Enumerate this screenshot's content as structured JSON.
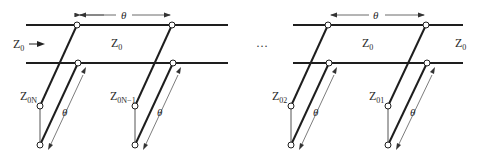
{
  "diagram": {
    "type": "transmission-line stub network",
    "colors": {
      "line": "#1e1e1e",
      "thin": "#555555",
      "text": "#2a2a2a",
      "background": "#ffffff"
    },
    "labels": {
      "input_impedance": {
        "main": "Z",
        "sub": "0"
      },
      "section_left": {
        "main": "Z",
        "sub": "0"
      },
      "section_right": {
        "main": "Z",
        "sub": "0"
      },
      "output_impedance": {
        "main": "Z",
        "sub": "0"
      },
      "ellipsis": "…",
      "theta": "θ"
    },
    "stubs": [
      {
        "main": "Z",
        "sub": "0N"
      },
      {
        "main": "Z",
        "sub": "0N−1"
      },
      {
        "main": "Z",
        "sub": "02"
      },
      {
        "main": "Z",
        "sub": "01"
      }
    ],
    "section_lengths": [
      "θ",
      "θ"
    ],
    "stub_lengths": [
      "θ",
      "θ",
      "θ",
      "θ"
    ]
  }
}
